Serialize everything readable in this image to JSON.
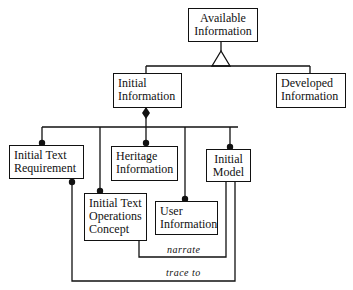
{
  "diagram": {
    "nodes": {
      "available": {
        "line1": "Available",
        "line2": "Information"
      },
      "initial_info": {
        "line1": "Initial",
        "line2": "Information"
      },
      "developed": {
        "line1": "Developed",
        "line2": "Information"
      },
      "text_req": {
        "line1": "Initial Text",
        "line2": "Requirement"
      },
      "heritage": {
        "line1": "Heritage",
        "line2": "Information"
      },
      "model": {
        "line1": "Initial",
        "line2": "Model"
      },
      "ops_concept": {
        "line1": "Initial Text",
        "line2": "Operations",
        "line3": "Concept"
      },
      "user_info": {
        "line1": "User",
        "line2": "Information"
      }
    },
    "edges": {
      "narrate": "narrate",
      "trace_to": "trace to"
    },
    "relations": [
      {
        "from": "Initial Information",
        "to": "Available Information",
        "type": "generalization"
      },
      {
        "from": "Developed Information",
        "to": "Available Information",
        "type": "generalization"
      },
      {
        "from": "Initial Information",
        "to": "Initial Text Requirement",
        "type": "aggregation"
      },
      {
        "from": "Initial Information",
        "to": "Initial Text Operations Concept",
        "type": "aggregation"
      },
      {
        "from": "Initial Information",
        "to": "Heritage Information",
        "type": "aggregation"
      },
      {
        "from": "Initial Information",
        "to": "User Information",
        "type": "aggregation"
      },
      {
        "from": "Initial Information",
        "to": "Initial Model",
        "type": "aggregation"
      },
      {
        "from": "Initial Text Operations Concept",
        "to": "Initial Model",
        "type": "association",
        "label": "narrate"
      },
      {
        "from": "Initial Text Requirement",
        "to": "Initial Model",
        "type": "association",
        "label": "trace to"
      }
    ]
  }
}
